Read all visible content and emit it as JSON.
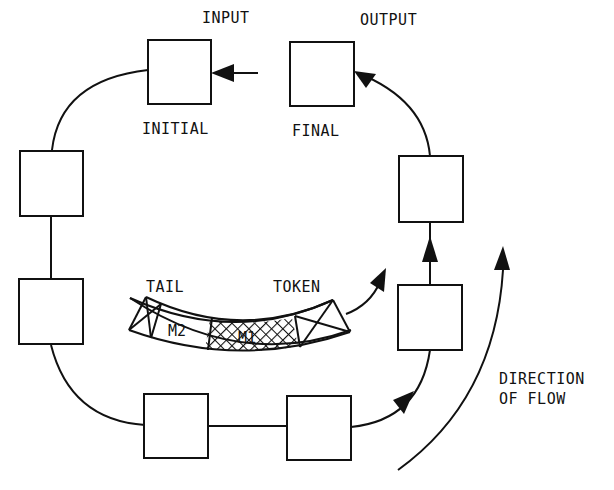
{
  "labels": {
    "input": "INPUT",
    "output": "OUTPUT",
    "initial": "INITIAL",
    "final": "FINAL",
    "tail": "TAIL",
    "token": "TOKEN",
    "direction_line1": "DIRECTION",
    "direction_line2": "OF FLOW",
    "segment_m2": "M2",
    "segment_m1": "M1"
  },
  "nodes": [
    {
      "id": "initial",
      "label_ref": "initial"
    },
    {
      "id": "left-upper"
    },
    {
      "id": "left-lower"
    },
    {
      "id": "bottom-left"
    },
    {
      "id": "bottom-right"
    },
    {
      "id": "right-lower"
    },
    {
      "id": "right-upper"
    },
    {
      "id": "final",
      "label_ref": "final"
    }
  ],
  "colors": {
    "stroke": "#111111",
    "background": "#ffffff"
  }
}
